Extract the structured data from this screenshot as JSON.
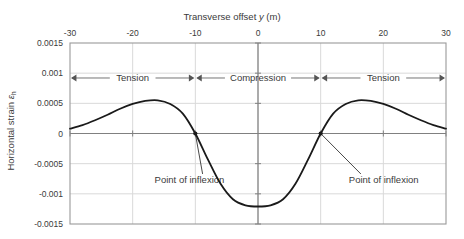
{
  "chart_data": {
    "type": "line",
    "title": "Transverse offset y (m)",
    "xlabel": "Transverse offset y (m)",
    "ylabel": "Horizontal strain εh",
    "xlabel_main": "Transverse offset ",
    "xlabel_var": "y",
    "xlabel_units": " (m)",
    "ylabel_main": "Horizontal strain ",
    "ylabel_var": "ε",
    "ylabel_sub": "h",
    "xlim": [
      -30,
      30
    ],
    "ylim": [
      -0.0015,
      0.0015
    ],
    "xticks": [
      -30,
      -20,
      -10,
      0,
      10,
      20,
      30
    ],
    "xtick_labels": [
      "-30",
      "-20",
      "-10",
      "0",
      "10",
      "20",
      "30"
    ],
    "yticks": [
      0.0015,
      0.001,
      0.0005,
      0,
      -0.0005,
      -0.001,
      -0.0015
    ],
    "ytick_labels": [
      "0.0015",
      "0.001",
      "0.0005",
      "0",
      "-0.0005",
      "-0.001",
      "-0.0015"
    ],
    "grid": true,
    "legend": null,
    "axis_position": "x-axis-top",
    "series": [
      {
        "name": "Horizontal strain",
        "color": "#1a1a1a",
        "x": [
          -30,
          -28,
          -26,
          -24,
          -22,
          -20,
          -18,
          -16,
          -14,
          -12,
          -10,
          -8,
          -6,
          -4,
          -2,
          0,
          2,
          4,
          6,
          8,
          10,
          12,
          14,
          16,
          18,
          20,
          22,
          24,
          26,
          28,
          30
        ],
        "y": [
          8e-05,
          0.00014,
          0.00022,
          0.00031,
          0.00041,
          0.00049,
          0.00054,
          0.00055,
          0.00049,
          0.00033,
          0.0,
          -0.00043,
          -0.00083,
          -0.00109,
          -0.00119,
          -0.00121,
          -0.00119,
          -0.00109,
          -0.00083,
          -0.00043,
          0.0,
          0.00033,
          0.00049,
          0.00055,
          0.00054,
          0.00049,
          0.00041,
          0.00031,
          0.00022,
          0.00014,
          8e-05
        ]
      }
    ],
    "annotations": [
      {
        "id": "tension-left",
        "label": "Tension",
        "x_from": -30,
        "x_to": -10,
        "y": 0.00092,
        "style": "double-arrow"
      },
      {
        "id": "compression",
        "label": "Compression",
        "x_from": -10,
        "x_to": 10,
        "y": 0.00092,
        "style": "double-arrow"
      },
      {
        "id": "tension-right",
        "label": "Tension",
        "x_from": 10,
        "x_to": 30,
        "y": 0.00092,
        "style": "double-arrow"
      },
      {
        "id": "inflexion-left",
        "label": "Point of inflexion",
        "point_x": -10,
        "point_y": 0.0,
        "label_x": -16.5,
        "label_y": -0.00077,
        "style": "leader-line"
      },
      {
        "id": "inflexion-right",
        "label": "Point of inflexion",
        "point_x": 10,
        "point_y": 0.0,
        "label_x": 14.5,
        "label_y": -0.00077,
        "style": "leader-line"
      }
    ]
  },
  "colors": {
    "curve": "#1a1a1a",
    "axis": "#808080",
    "grid": "#d9d9d9",
    "text": "#3a3a3a",
    "background": "#ffffff"
  }
}
